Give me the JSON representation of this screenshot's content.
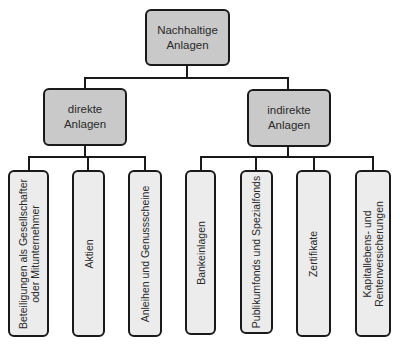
{
  "diagram": {
    "type": "hierarchy",
    "root": {
      "line1": "Nachhaltige",
      "line2": "Anlagen"
    },
    "branches": [
      {
        "line1": "direkte",
        "line2": "Anlagen",
        "children": [
          {
            "line1": "Beteiligungen als Gesellschafter",
            "line2": "oder Mitunternehmer"
          },
          {
            "line1": "Aktien",
            "line2": ""
          },
          {
            "line1": "Anleihen und Genussscheine",
            "line2": ""
          }
        ]
      },
      {
        "line1": "indirekte",
        "line2": "Anlagen",
        "children": [
          {
            "line1": "Bankeinlagen",
            "line2": ""
          },
          {
            "line1": "Publikumfonds und Spezialfonds",
            "line2": ""
          },
          {
            "line1": "Zertifikate",
            "line2": ""
          },
          {
            "line1": "Kapitallebens- und",
            "line2": "Rentenversicherungen"
          }
        ]
      }
    ],
    "colors": {
      "node_dark": "#c9c9c9",
      "node_light": "#ececec",
      "border": "#1a1a1a"
    }
  }
}
